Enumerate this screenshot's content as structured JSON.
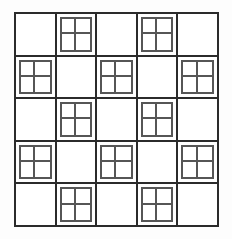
{
  "figure": {
    "rows": 5,
    "columns": 5,
    "total_major_cells": 25,
    "empty_cells": 13,
    "subdivided_cells": 12,
    "quadrants_per_subdivided_cell": 4,
    "total_small_squares": 48
  },
  "style": {
    "background_color": "#fdfdfd",
    "cell_fill_color": "#ffffff",
    "major_line_color": "#2b2b2b",
    "minor_line_color": "#565656",
    "major_line_width_px": 2,
    "minor_line_width_px": 2
  },
  "geometry": {
    "frame_left_px": 14,
    "frame_top_px": 12,
    "frame_width_px": 205,
    "frame_height_px": 215,
    "cell_width_px": 41,
    "cell_height_px": 43
  },
  "grid": {
    "pattern_rule": "A cell is subdivided when (row_index + column_index) is odd; otherwise it is empty.",
    "cells": [
      {
        "row": 0,
        "col": 0,
        "type": "empty"
      },
      {
        "row": 0,
        "col": 1,
        "type": "subdivided"
      },
      {
        "row": 0,
        "col": 2,
        "type": "empty"
      },
      {
        "row": 0,
        "col": 3,
        "type": "subdivided"
      },
      {
        "row": 0,
        "col": 4,
        "type": "empty"
      },
      {
        "row": 1,
        "col": 0,
        "type": "subdivided"
      },
      {
        "row": 1,
        "col": 1,
        "type": "empty"
      },
      {
        "row": 1,
        "col": 2,
        "type": "subdivided"
      },
      {
        "row": 1,
        "col": 3,
        "type": "empty"
      },
      {
        "row": 1,
        "col": 4,
        "type": "subdivided"
      },
      {
        "row": 2,
        "col": 0,
        "type": "empty"
      },
      {
        "row": 2,
        "col": 1,
        "type": "subdivided"
      },
      {
        "row": 2,
        "col": 2,
        "type": "empty"
      },
      {
        "row": 2,
        "col": 3,
        "type": "subdivided"
      },
      {
        "row": 2,
        "col": 4,
        "type": "empty"
      },
      {
        "row": 3,
        "col": 0,
        "type": "subdivided"
      },
      {
        "row": 3,
        "col": 1,
        "type": "empty"
      },
      {
        "row": 3,
        "col": 2,
        "type": "subdivided"
      },
      {
        "row": 3,
        "col": 3,
        "type": "empty"
      },
      {
        "row": 3,
        "col": 4,
        "type": "subdivided"
      },
      {
        "row": 4,
        "col": 0,
        "type": "empty"
      },
      {
        "row": 4,
        "col": 1,
        "type": "subdivided"
      },
      {
        "row": 4,
        "col": 2,
        "type": "empty"
      },
      {
        "row": 4,
        "col": 3,
        "type": "subdivided"
      },
      {
        "row": 4,
        "col": 4,
        "type": "empty"
      }
    ]
  }
}
